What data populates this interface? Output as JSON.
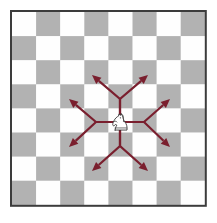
{
  "figure": {
    "canvas": {
      "width": 217,
      "height": 223,
      "background": "#ffffff"
    }
  },
  "board": {
    "name": "chessboard",
    "origin_x": 12,
    "origin_y": 12,
    "square_size": 24.1,
    "files": 8,
    "ranks": 8,
    "light_square_color": "#fefefe",
    "dark_square_color": "#b2b2b2",
    "border_color": "#3c3c3c",
    "border_width": 2,
    "top_left_square": "light"
  },
  "piece": {
    "name": "white-knight",
    "label": "Knight",
    "square_col": 4,
    "square_row": 4,
    "center_x": 120,
    "center_y": 122,
    "fill": "#ffffff",
    "stroke": "#333333",
    "facing": "right"
  },
  "arrows": {
    "color": "#7a1f2e",
    "stroke_width": 2.2,
    "head_length": 9,
    "head_width": 8,
    "origin_x": 120,
    "origin_y": 122,
    "moves": [
      {
        "name": "up-left",
        "notation": "2 up 1 left",
        "tip_x": 92,
        "tip_y": 75,
        "elbow_x": 120,
        "elbow_y": 99
      },
      {
        "name": "up-right",
        "notation": "2 up 1 right",
        "tip_x": 148,
        "tip_y": 75,
        "elbow_x": 120,
        "elbow_y": 99
      },
      {
        "name": "left-up",
        "notation": "1 up 2 left",
        "tip_x": 69,
        "tip_y": 99,
        "elbow_x": 96,
        "elbow_y": 122
      },
      {
        "name": "right-up",
        "notation": "1 up 2 right",
        "tip_x": 170,
        "tip_y": 99,
        "elbow_x": 144,
        "elbow_y": 122
      },
      {
        "name": "left-down",
        "notation": "1 down 2 left",
        "tip_x": 69,
        "tip_y": 147,
        "elbow_x": 96,
        "elbow_y": 122
      },
      {
        "name": "right-down",
        "notation": "1 down 2 right",
        "tip_x": 170,
        "tip_y": 147,
        "elbow_x": 144,
        "elbow_y": 122
      },
      {
        "name": "down-left",
        "notation": "2 down 1 left",
        "tip_x": 92,
        "tip_y": 171,
        "elbow_x": 120,
        "elbow_y": 146
      },
      {
        "name": "down-right",
        "notation": "2 down 1 right",
        "tip_x": 148,
        "tip_y": 171,
        "elbow_x": 120,
        "elbow_y": 146
      }
    ]
  }
}
